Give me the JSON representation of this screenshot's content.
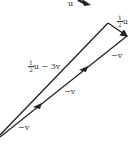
{
  "diagram": {
    "type": "vector-triangle",
    "stroke_color": "#222222",
    "labels": {
      "top_partial": "u",
      "half_u": {
        "num": "1",
        "den": "2",
        "var": "u"
      },
      "resultant": {
        "num": "1",
        "den": "2",
        "var": "u",
        "rest": "− 3v"
      },
      "neg_v_1": "−v",
      "neg_v_2": "−v",
      "neg_v_3": "−v"
    }
  }
}
